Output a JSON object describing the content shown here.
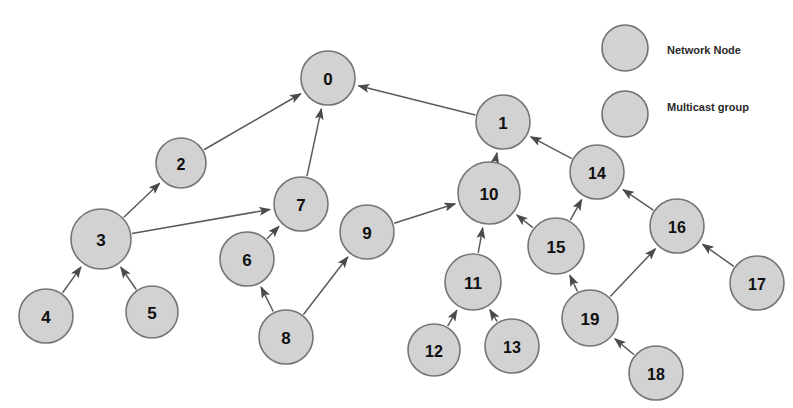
{
  "diagram": {
    "background_color": "#ffffff",
    "node_fill_color": "#d2d2d2",
    "node_stroke_color": "#757575",
    "edge_color": "#5a5a5a",
    "label_color": "#101010",
    "nodes": [
      {
        "id": "0",
        "label": "0",
        "cx": 328,
        "cy": 78,
        "r": 27,
        "font_size": 17
      },
      {
        "id": "1",
        "label": "1",
        "cx": 503,
        "cy": 122,
        "r": 27,
        "font_size": 17
      },
      {
        "id": "2",
        "label": "2",
        "cx": 181,
        "cy": 163,
        "r": 25,
        "font_size": 16
      },
      {
        "id": "3",
        "label": "3",
        "cx": 101,
        "cy": 239,
        "r": 30,
        "font_size": 17
      },
      {
        "id": "4",
        "label": "4",
        "cx": 46,
        "cy": 316,
        "r": 27,
        "font_size": 17
      },
      {
        "id": "5",
        "label": "5",
        "cx": 152,
        "cy": 312,
        "r": 26,
        "font_size": 17
      },
      {
        "id": "6",
        "label": "6",
        "cx": 247,
        "cy": 259,
        "r": 27,
        "font_size": 17
      },
      {
        "id": "7",
        "label": "7",
        "cx": 301,
        "cy": 204,
        "r": 27,
        "font_size": 17
      },
      {
        "id": "8",
        "label": "8",
        "cx": 286,
        "cy": 337,
        "r": 27,
        "font_size": 17
      },
      {
        "id": "9",
        "label": "9",
        "cx": 367,
        "cy": 232,
        "r": 27,
        "font_size": 17
      },
      {
        "id": "10",
        "label": "10",
        "cx": 489,
        "cy": 193,
        "r": 31,
        "font_size": 17
      },
      {
        "id": "11",
        "label": "11",
        "cx": 473,
        "cy": 282,
        "r": 28,
        "font_size": 17
      },
      {
        "id": "12",
        "label": "12",
        "cx": 434,
        "cy": 350,
        "r": 26,
        "font_size": 16
      },
      {
        "id": "13",
        "label": "13",
        "cx": 512,
        "cy": 346,
        "r": 27,
        "font_size": 16
      },
      {
        "id": "14",
        "label": "14",
        "cx": 597,
        "cy": 172,
        "r": 27,
        "font_size": 16
      },
      {
        "id": "15",
        "label": "15",
        "cx": 556,
        "cy": 246,
        "r": 28,
        "font_size": 17
      },
      {
        "id": "16",
        "label": "16",
        "cx": 677,
        "cy": 226,
        "r": 27,
        "font_size": 16
      },
      {
        "id": "17",
        "label": "17",
        "cx": 757,
        "cy": 283,
        "r": 27,
        "font_size": 16
      },
      {
        "id": "18",
        "label": "18",
        "cx": 656,
        "cy": 373,
        "r": 27,
        "font_size": 16
      },
      {
        "id": "19",
        "label": "19",
        "cx": 590,
        "cy": 318,
        "r": 28,
        "font_size": 17
      }
    ],
    "edges": [
      {
        "from": "2",
        "to": "0"
      },
      {
        "from": "7",
        "to": "0"
      },
      {
        "from": "1",
        "to": "0"
      },
      {
        "from": "3",
        "to": "2"
      },
      {
        "from": "4",
        "to": "3"
      },
      {
        "from": "5",
        "to": "3"
      },
      {
        "from": "3",
        "to": "7"
      },
      {
        "from": "6",
        "to": "7"
      },
      {
        "from": "8",
        "to": "6"
      },
      {
        "from": "8",
        "to": "9"
      },
      {
        "from": "9",
        "to": "10"
      },
      {
        "from": "10",
        "to": "1"
      },
      {
        "from": "14",
        "to": "1"
      },
      {
        "from": "11",
        "to": "10"
      },
      {
        "from": "15",
        "to": "10"
      },
      {
        "from": "12",
        "to": "11"
      },
      {
        "from": "13",
        "to": "11"
      },
      {
        "from": "15",
        "to": "14"
      },
      {
        "from": "16",
        "to": "14"
      },
      {
        "from": "19",
        "to": "15"
      },
      {
        "from": "19",
        "to": "16"
      },
      {
        "from": "17",
        "to": "16"
      },
      {
        "from": "18",
        "to": "19"
      }
    ]
  },
  "legend": {
    "items": [
      {
        "label": "Network Node",
        "cx": 625,
        "cy": 48,
        "r": 23,
        "text_x": 667,
        "text_y": 50
      },
      {
        "label": "Multicast group",
        "cx": 625,
        "cy": 114,
        "r": 23,
        "text_x": 667,
        "text_y": 107
      }
    ]
  }
}
